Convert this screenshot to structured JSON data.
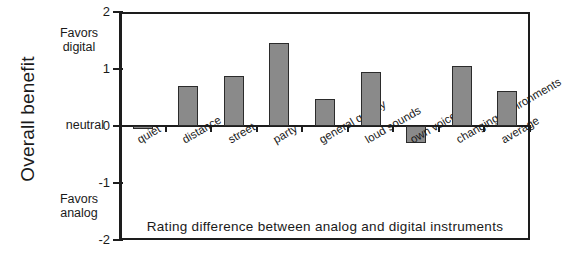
{
  "chart_data": {
    "type": "bar",
    "title": "",
    "caption": "Rating  difference  between  analog  and  digital  instruments",
    "ylabel": "Overall benefit",
    "xlabel": "",
    "ylim": [
      -2,
      2
    ],
    "grid": false,
    "legend": "none",
    "orientation": "vertical",
    "bar_color": "#8a8a8a",
    "bar_edge_color": "#2b2b2b",
    "axis_color": "#1d1d1d",
    "yticks": [
      2,
      1,
      0,
      -1,
      -2
    ],
    "ytick_labels": [
      "2",
      "1",
      "0",
      "-1",
      "-2"
    ],
    "annotations": [
      {
        "name": "favors-digital",
        "line1": "Favors",
        "line2": "digital"
      },
      {
        "name": "neutral",
        "text": "neutral"
      },
      {
        "name": "favors-analog",
        "line1": "Favors",
        "line2": "analog"
      }
    ],
    "categories": [
      "quiet",
      "distance",
      "street",
      "party",
      "general quality",
      "loud sounds",
      "own voice",
      "changing environments",
      "average"
    ],
    "values": [
      -0.05,
      0.7,
      0.87,
      1.45,
      0.47,
      0.95,
      -0.3,
      1.05,
      0.62
    ]
  }
}
